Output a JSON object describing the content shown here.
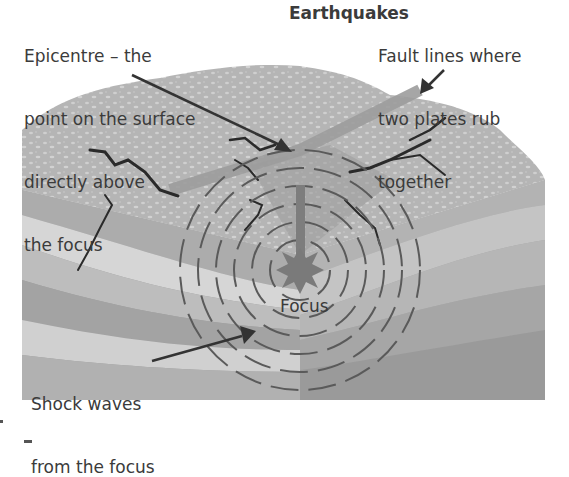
{
  "diagram": {
    "title": "Earthquakes",
    "labels": {
      "epicentre": [
        "Epicentre – the",
        "point on the surface",
        "directly above",
        "the focus"
      ],
      "fault_lines": [
        "Fault lines where",
        "two plates rub",
        "together"
      ],
      "focus": "Focus",
      "shock_waves": [
        "Shock waves",
        "from the focus"
      ]
    },
    "colors": {
      "surface": "#b9b9b9",
      "surface_speckle": "#d0d0d0",
      "layer_light": "#d4d4d4",
      "layer_mid": "#a9a9a9",
      "layer_dark": "#8f8f8f",
      "crack": "#2a2a2a",
      "wave": "#5a5a5a",
      "arrow": "#333333",
      "focus_star": "#7d7d7d"
    }
  }
}
